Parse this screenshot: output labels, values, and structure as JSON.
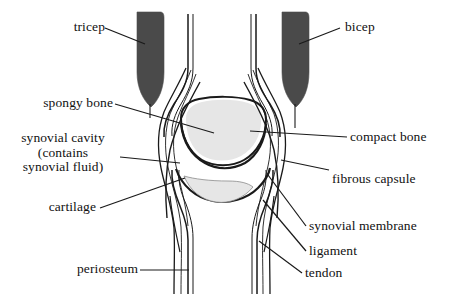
{
  "figure": {
    "kind": "anatomical-diagram",
    "background_color": "#ffffff",
    "line_color": "#1a1a1a",
    "muscle_color": "#4a4a4a",
    "spongy_bone_fill": "#e6e6e6",
    "cartilage_fill": "#ebebeb",
    "bone_fill": "#ffffff"
  },
  "labels": {
    "tricep": "tricep",
    "bicep": "bicep",
    "spongy_bone": "spongy bone",
    "synovial_cavity": "synovial cavity\n(contains\nsynovial fluid)",
    "cartilage": "cartilage",
    "periosteum": "periosteum",
    "compact_bone": "compact bone",
    "fibrous_capsule": "fibrous capsule",
    "synovial_membrane": "synovial membrane",
    "ligament": "ligament",
    "tendon": "tendon"
  }
}
